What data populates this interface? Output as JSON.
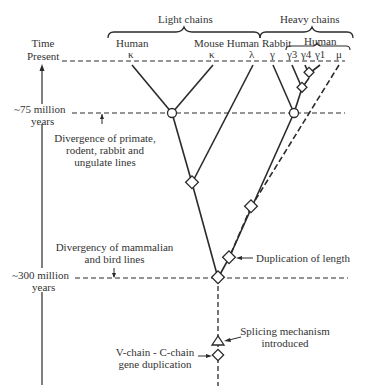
{
  "header": {
    "light_chains": "Light chains",
    "heavy_chains": "Heavy chains",
    "human_heavy_group": "Human"
  },
  "species": {
    "human_kappa": "Human",
    "mouse_human": "Mouse Human",
    "rabbit": "Rabbit"
  },
  "chains": {
    "kappa1": "κ",
    "kappa2": "κ",
    "lambda": "λ",
    "gamma_rabbit": "γ",
    "gamma3": "γ3",
    "gamma4": "γ4",
    "gamma1": "γ1",
    "mu": "μ"
  },
  "timeline": {
    "time_label": "Time",
    "present_label": "Present",
    "t75_line1": "~75 million",
    "t75_line2": "years",
    "t300_line1": "~300 million",
    "t300_line2": "years"
  },
  "annotations": {
    "divergence_primate_1": "Divergence of primate,",
    "divergence_primate_2": "rodent, rabbit and",
    "divergence_primate_3": "ungulate lines",
    "divergency_mammal_1": "Divergency of mammalian",
    "divergency_mammal_2": "and bird lines",
    "duplication_length": "Duplication of length",
    "splicing_1": "Splicing mechanism",
    "splicing_2": "introduced",
    "vc_dup_1": "V-chain - C-chain",
    "vc_dup_2": "gene duplication"
  },
  "colors": {
    "line": "#2a2a2a",
    "background": "#ffffff"
  }
}
